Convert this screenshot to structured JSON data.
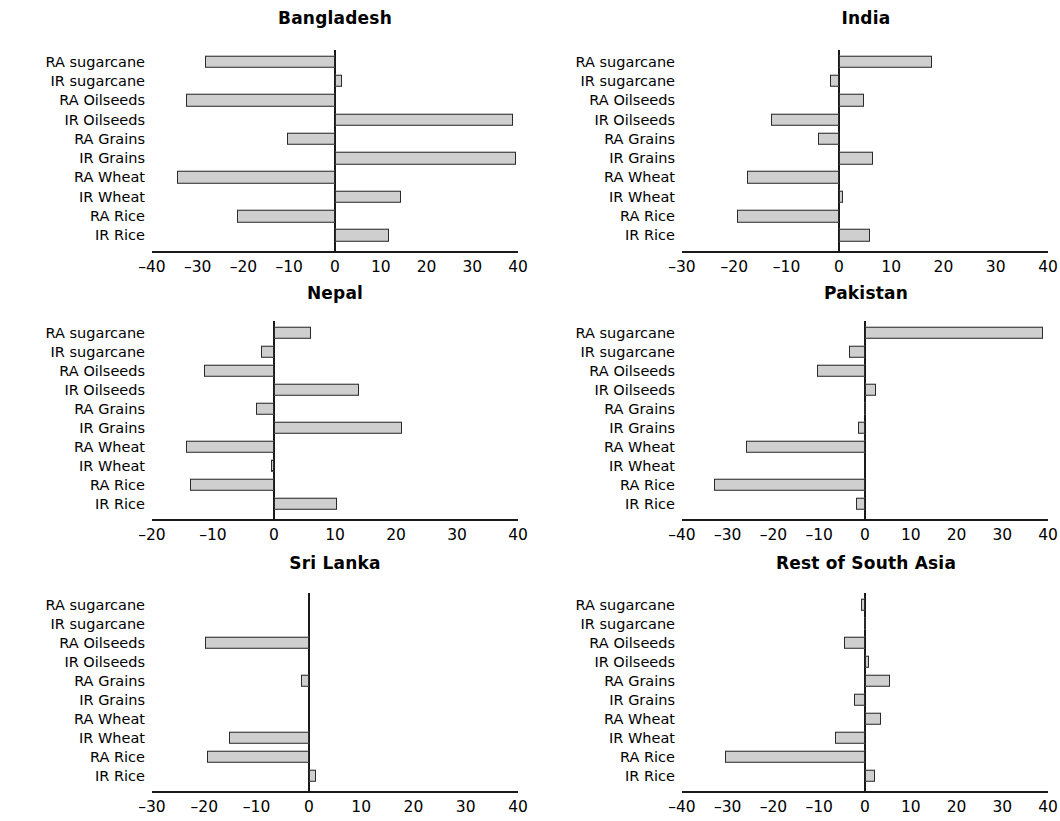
{
  "figure": {
    "categories": [
      "IR Rice",
      "RA Rice",
      "IR Wheat",
      "RA Wheat",
      "IR Grains",
      "RA Grains",
      "IR Oilseeds",
      "RA Oilseeds",
      "IR sugarcane",
      "RA sugarcane"
    ],
    "bar_fill": "#cfcfcf",
    "bar_stroke": "#2b2b2b",
    "axis_color": "#1a1a1a",
    "background": "#ffffff"
  },
  "chart_data": [
    {
      "type": "bar",
      "title": "Bangladesh",
      "orientation": "horizontal",
      "categories": [
        "IR Rice",
        "RA Rice",
        "IR Wheat",
        "RA Wheat",
        "IR Grains",
        "RA Grains",
        "IR Oilseeds",
        "RA Oilseeds",
        "IR sugarcane",
        "RA sugarcane"
      ],
      "values": [
        11.8,
        -21.5,
        14.5,
        -34.5,
        39.5,
        -10.5,
        39.0,
        -32.5,
        1.5,
        -28.5
      ],
      "xlabel": "",
      "ylabel": "",
      "xlim": [
        -40,
        40
      ],
      "xticks": [
        -40,
        -30,
        -20,
        -10,
        0,
        10,
        20,
        30,
        40
      ],
      "xticklabels": [
        "–40",
        "–30",
        "–20",
        "–10",
        "0",
        "10",
        "20",
        "30",
        "40"
      ],
      "grid": false,
      "legend": "none"
    },
    {
      "type": "bar",
      "title": "India",
      "orientation": "horizontal",
      "categories": [
        "IR Rice",
        "RA Rice",
        "IR Wheat",
        "RA Wheat",
        "IR Grains",
        "RA Grains",
        "IR Oilseeds",
        "RA Oilseeds",
        "IR sugarcane",
        "RA sugarcane"
      ],
      "values": [
        6.0,
        -19.5,
        0.7,
        -17.5,
        6.5,
        -4.0,
        -13.0,
        4.8,
        -1.7,
        17.8
      ],
      "xlabel": "",
      "ylabel": "",
      "xlim": [
        -30,
        40
      ],
      "xticks": [
        -30,
        -20,
        -10,
        0,
        10,
        20,
        30,
        40
      ],
      "xticklabels": [
        "–30",
        "–20",
        "–10",
        "0",
        "10",
        "20",
        "30",
        "40"
      ],
      "grid": false,
      "legend": "none"
    },
    {
      "type": "bar",
      "title": "Nepal",
      "orientation": "horizontal",
      "categories": [
        "IR Rice",
        "RA Rice",
        "IR Wheat",
        "RA Wheat",
        "IR Grains",
        "RA Grains",
        "IR Oilseeds",
        "RA Oilseeds",
        "IR sugarcane",
        "RA sugarcane"
      ],
      "values": [
        10.3,
        -13.8,
        -0.5,
        -14.5,
        21.0,
        -3.0,
        14.0,
        -11.5,
        -2.2,
        6.0
      ],
      "xlabel": "",
      "ylabel": "",
      "xlim": [
        -20,
        40
      ],
      "xticks": [
        -20,
        -10,
        0,
        10,
        20,
        30,
        40
      ],
      "xticklabels": [
        "–20",
        "–10",
        "0",
        "10",
        "20",
        "30",
        "40"
      ],
      "grid": false,
      "legend": "none"
    },
    {
      "type": "bar",
      "title": "Pakistan",
      "orientation": "horizontal",
      "categories": [
        "IR Rice",
        "RA Rice",
        "IR Wheat",
        "RA Wheat",
        "IR Grains",
        "RA Grains",
        "IR Oilseeds",
        "RA Oilseeds",
        "IR sugarcane",
        "RA sugarcane"
      ],
      "values": [
        -2.0,
        -33.0,
        0.0,
        -26.0,
        -1.5,
        -0.3,
        2.5,
        -10.5,
        -3.5,
        39.0
      ],
      "xlabel": "",
      "ylabel": "",
      "xlim": [
        -40,
        40
      ],
      "xticks": [
        -40,
        -30,
        -20,
        -10,
        0,
        10,
        20,
        30,
        40
      ],
      "xticklabels": [
        "–40",
        "–30",
        "–20",
        "–10",
        "0",
        "10",
        "20",
        "30",
        "40"
      ],
      "grid": false,
      "legend": "none"
    },
    {
      "type": "bar",
      "title": "Sri Lanka",
      "orientation": "horizontal",
      "categories": [
        "IR Rice",
        "RA Rice",
        "IR Wheat",
        "RA Wheat",
        "IR Grains",
        "RA Grains",
        "IR Oilseeds",
        "RA Oilseeds",
        "IR sugarcane",
        "RA sugarcane"
      ],
      "values": [
        1.4,
        -19.5,
        -15.3,
        0.0,
        0.0,
        -1.5,
        0.0,
        -19.8,
        0.0,
        0.0
      ],
      "xlabel": "",
      "ylabel": "",
      "xlim": [
        -30,
        40
      ],
      "xticks": [
        -30,
        -20,
        -10,
        0,
        10,
        20,
        30,
        40
      ],
      "xticklabels": [
        "–30",
        "–20",
        "–10",
        "0",
        "10",
        "20",
        "30",
        "40"
      ],
      "grid": false,
      "legend": "none"
    },
    {
      "type": "bar",
      "title": "Rest of South Asia",
      "orientation": "horizontal",
      "categories": [
        "IR Rice",
        "RA Rice",
        "IR Wheat",
        "RA Wheat",
        "IR Grains",
        "RA Grains",
        "IR Oilseeds",
        "RA Oilseeds",
        "IR sugarcane",
        "RA sugarcane"
      ],
      "values": [
        2.2,
        -30.5,
        -6.5,
        3.5,
        -2.5,
        5.5,
        0.9,
        -4.5,
        -0.2,
        -0.8
      ],
      "xlabel": "",
      "ylabel": "",
      "xlim": [
        -40,
        40
      ],
      "xticks": [
        -40,
        -30,
        -20,
        -10,
        0,
        10,
        20,
        30,
        40
      ],
      "xticklabels": [
        "–40",
        "–30",
        "–20",
        "–10",
        "0",
        "10",
        "20",
        "30",
        "40"
      ],
      "grid": false,
      "legend": "none"
    }
  ]
}
